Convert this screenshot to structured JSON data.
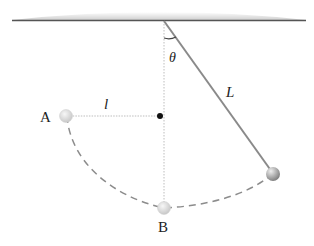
{
  "diagram": {
    "labels": {
      "point_a": "A",
      "point_b": "B",
      "short_length": "l",
      "long_length": "L",
      "angle": "θ"
    },
    "colors": {
      "ceiling_fill": "#d6d6d6",
      "ceiling_edge": "#555555",
      "string": "#8a8a8a",
      "dashed_path": "#8c8c8c",
      "bob_light": "#e6e6e6",
      "bob_dark": "#a0a0a0",
      "peg": "#111111"
    }
  }
}
